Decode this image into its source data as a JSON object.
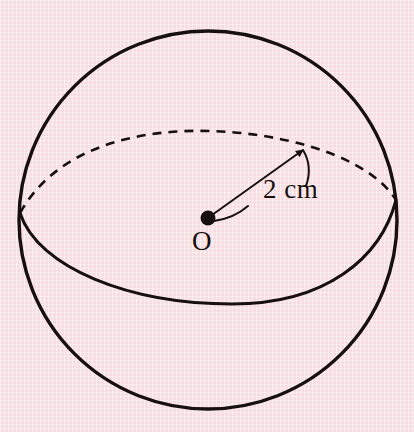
{
  "figure": {
    "name": "sphere-with-radius",
    "background_color": "#f7dde1",
    "ink_color": "#16100f"
  },
  "labels": {
    "center_point": "O",
    "radius": "2 cm"
  },
  "cropped_heading": {
    "visible_fragment": ""
  },
  "geometry": {
    "canvas": {
      "width": 414,
      "height": 432
    },
    "sphere_outline": {
      "center_x": 208,
      "center_y": 220,
      "radius": 189,
      "stroke_width": 3.4
    },
    "equator_front_arc": {
      "style": "solid",
      "left_x": 20,
      "left_y": 213,
      "right_x": 396,
      "right_y": 200,
      "lowest_y": 304,
      "stroke_width": 3.0
    },
    "equator_back_arc": {
      "style": "dashed",
      "left_x": 20,
      "left_y": 213,
      "right_x": 396,
      "right_y": 200,
      "highest_y": 140,
      "stroke_width": 2.6,
      "dash_pattern": "9 7"
    },
    "center_dot": {
      "x": 208,
      "y": 218,
      "radius": 7.5
    },
    "radius_line": {
      "from_x": 208,
      "from_y": 218,
      "to_x": 306,
      "to_y": 147,
      "has_arrowhead": true,
      "stroke_width": 2.0
    },
    "leader_curve": {
      "from_x": 216,
      "from_y": 221,
      "to_x": 247,
      "to_y": 207,
      "stroke_width": 2.0
    }
  }
}
